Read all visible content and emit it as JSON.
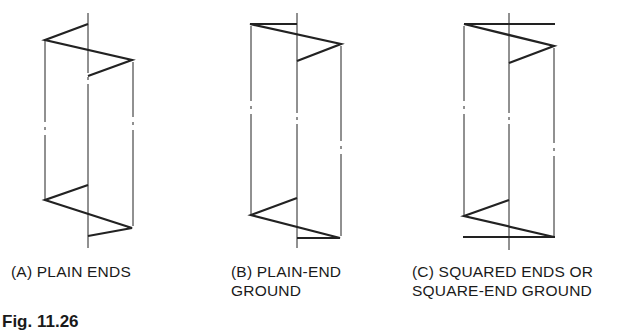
{
  "figure": {
    "caption_visible": "Fig. 11.26",
    "panels": [
      {
        "id": "A",
        "label_line1": "(A) PLAIN ENDS",
        "label_line2": "",
        "end_type": "plain"
      },
      {
        "id": "B",
        "label_line1": "(B) PLAIN-END",
        "label_line2": "GROUND",
        "end_type": "plain-ground"
      },
      {
        "id": "C",
        "label_line1": "(C) SQUARED ENDS OR",
        "label_line2": "SQUARE-END GROUND",
        "end_type": "squared"
      }
    ]
  }
}
